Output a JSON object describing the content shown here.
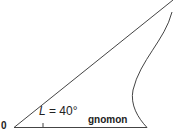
{
  "diagram": {
    "origin_label": "0",
    "angle_symbol": "L",
    "angle_value": " = 40°",
    "gnomon_label": "gnomon",
    "line_color": "#444444"
  }
}
